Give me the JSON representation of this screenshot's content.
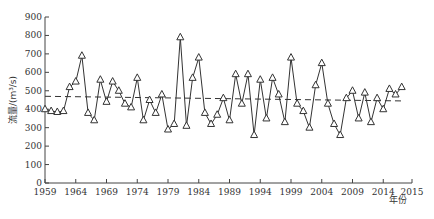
{
  "chart_data": {
    "type": "line",
    "title": "",
    "xlabel": "年份",
    "ylabel": "流量/(m³/s)",
    "ylim": [
      0,
      900
    ],
    "xlim": [
      1959,
      2018
    ],
    "y_ticks": [
      0,
      100,
      200,
      300,
      400,
      500,
      600,
      700,
      800,
      900
    ],
    "x_ticks": [
      "1959",
      "1964",
      "1969",
      "1974",
      "1979",
      "1984",
      "1989",
      "1994",
      "1999",
      "2004",
      "2009",
      "2014",
      "2015"
    ],
    "grid": false,
    "legend": [],
    "marker": "triangle-open",
    "x": [
      1959,
      1960,
      1961,
      1962,
      1963,
      1964,
      1965,
      1966,
      1967,
      1968,
      1969,
      1970,
      1971,
      1972,
      1973,
      1974,
      1975,
      1976,
      1977,
      1978,
      1979,
      1980,
      1981,
      1982,
      1983,
      1984,
      1985,
      1986,
      1987,
      1988,
      1989,
      1990,
      1991,
      1992,
      1993,
      1994,
      1995,
      1996,
      1997,
      1998,
      1999,
      2000,
      2001,
      2002,
      2003,
      2004,
      2005,
      2006,
      2007,
      2008,
      2009,
      2010,
      2011,
      2012,
      2013,
      2014,
      2015,
      2016,
      2017
    ],
    "series": [
      {
        "name": "年均流量",
        "values": [
          400,
          390,
          385,
          390,
          520,
          550,
          690,
          380,
          340,
          560,
          440,
          550,
          500,
          430,
          410,
          570,
          340,
          450,
          380,
          480,
          290,
          320,
          790,
          310,
          570,
          680,
          380,
          320,
          370,
          460,
          340,
          590,
          430,
          590,
          260,
          560,
          350,
          570,
          480,
          330,
          680,
          430,
          390,
          300,
          530,
          650,
          430,
          320,
          260,
          460,
          500,
          350,
          490,
          330,
          460,
          400,
          510,
          480,
          520
        ]
      },
      {
        "name": "趋势线",
        "style": "dashed",
        "x": [
          1959,
          2017
        ],
        "values": [
          470,
          445
        ]
      }
    ]
  }
}
